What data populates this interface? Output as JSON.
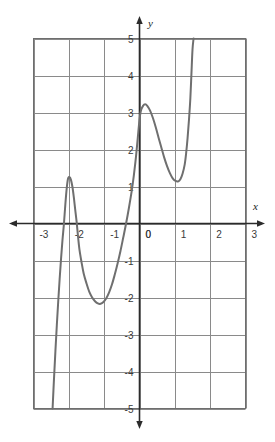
{
  "chart_data": {
    "type": "line",
    "title": "",
    "subtitle": "",
    "xlabel": "x",
    "ylabel": "y",
    "xlim": [
      -3,
      3
    ],
    "ylim": [
      -5,
      5
    ],
    "grid": true,
    "legend": null,
    "x_ticks": [
      "-3",
      "-2",
      "-1",
      "0",
      "1",
      "2",
      "3"
    ],
    "x_tick_values": [
      -3,
      -2,
      -1,
      0,
      1,
      2,
      3
    ],
    "y_ticks": [
      "5",
      "4",
      "3",
      "2",
      "1",
      "0",
      "-1",
      "-2",
      "-3",
      "-4",
      "-5"
    ],
    "y_tick_values": [
      5,
      4,
      3,
      2,
      1,
      0,
      -1,
      -2,
      -3,
      -4,
      -5
    ],
    "series": [
      {
        "name": "curve",
        "color": "#6f6f6f",
        "points": [
          [
            -2.46,
            -5.0
          ],
          [
            -2.42,
            -4.2
          ],
          [
            -2.38,
            -3.45
          ],
          [
            -2.34,
            -2.75
          ],
          [
            -2.3,
            -2.1
          ],
          [
            -2.26,
            -1.5
          ],
          [
            -2.22,
            -0.95
          ],
          [
            -2.18,
            -0.45
          ],
          [
            -2.14,
            -0.02
          ],
          [
            -2.1,
            0.5
          ],
          [
            -2.06,
            0.95
          ],
          [
            -2.02,
            1.22
          ],
          [
            -1.98,
            1.25
          ],
          [
            -1.94,
            1.18
          ],
          [
            -1.9,
            1.0
          ],
          [
            -1.86,
            0.72
          ],
          [
            -1.82,
            0.38
          ],
          [
            -1.78,
            0.05
          ],
          [
            -1.74,
            -0.35
          ],
          [
            -1.7,
            -0.7
          ],
          [
            -1.64,
            -1.05
          ],
          [
            -1.58,
            -1.35
          ],
          [
            -1.5,
            -1.62
          ],
          [
            -1.42,
            -1.85
          ],
          [
            -1.34,
            -2.0
          ],
          [
            -1.26,
            -2.1
          ],
          [
            -1.18,
            -2.16
          ],
          [
            -1.1,
            -2.17
          ],
          [
            -1.02,
            -2.12
          ],
          [
            -0.94,
            -2.02
          ],
          [
            -0.86,
            -1.86
          ],
          [
            -0.78,
            -1.65
          ],
          [
            -0.7,
            -1.38
          ],
          [
            -0.62,
            -1.08
          ],
          [
            -0.54,
            -0.75
          ],
          [
            -0.46,
            -0.38
          ],
          [
            -0.38,
            0.0
          ],
          [
            -0.3,
            0.42
          ],
          [
            -0.22,
            0.88
          ],
          [
            -0.16,
            1.3
          ],
          [
            -0.1,
            1.8
          ],
          [
            -0.05,
            2.3
          ],
          [
            0.0,
            2.8
          ],
          [
            0.04,
            3.05
          ],
          [
            0.1,
            3.18
          ],
          [
            0.16,
            3.22
          ],
          [
            0.22,
            3.18
          ],
          [
            0.3,
            3.05
          ],
          [
            0.38,
            2.85
          ],
          [
            0.46,
            2.6
          ],
          [
            0.54,
            2.32
          ],
          [
            0.62,
            2.05
          ],
          [
            0.7,
            1.78
          ],
          [
            0.78,
            1.55
          ],
          [
            0.86,
            1.36
          ],
          [
            0.94,
            1.22
          ],
          [
            1.02,
            1.15
          ],
          [
            1.1,
            1.14
          ],
          [
            1.16,
            1.2
          ],
          [
            1.22,
            1.35
          ],
          [
            1.28,
            1.6
          ],
          [
            1.32,
            1.9
          ],
          [
            1.36,
            2.3
          ],
          [
            1.4,
            2.8
          ],
          [
            1.44,
            3.4
          ],
          [
            1.47,
            4.05
          ],
          [
            1.5,
            4.7
          ],
          [
            1.53,
            5.0
          ]
        ]
      }
    ],
    "features": {
      "local_maxima": [
        {
          "x": -2.0,
          "y": 1.25
        },
        {
          "x": 0.16,
          "y": 3.22
        }
      ],
      "local_minima": [
        {
          "x": -1.1,
          "y": -2.17
        },
        {
          "x": 1.1,
          "y": 1.14
        }
      ],
      "x_intercepts": [
        -2.14,
        -1.77,
        -0.38
      ],
      "y_intercept": 2.8
    },
    "colors": {
      "curve": "#6f6f6f",
      "grid": "#8a8a8a",
      "axis": "#2b2b2b",
      "plot_border": "#6e6e6e",
      "background": "#ffffff",
      "tick_label": "#3a3a3a"
    }
  }
}
